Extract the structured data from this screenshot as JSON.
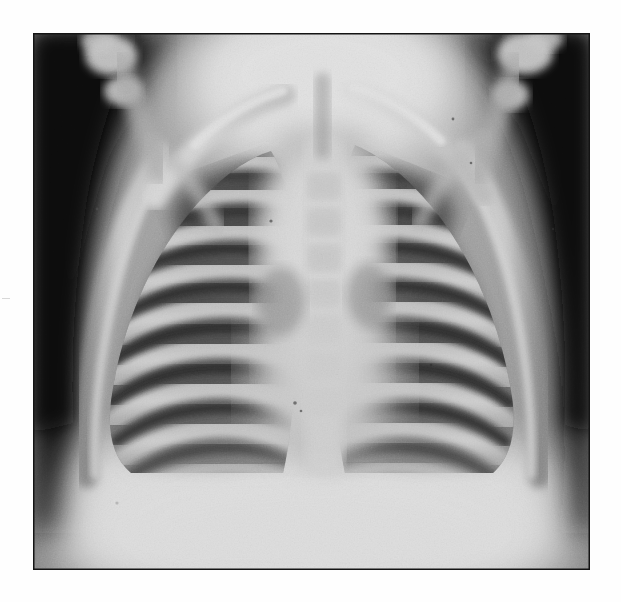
{
  "document": {
    "type": "radiograph-photograph",
    "modality_label": "chest-radiograph",
    "view_label": "anteroposterior",
    "subject_label": "pediatric-thorax",
    "page_background_color": "#fefefe",
    "caption_text": ""
  },
  "image": {
    "frame_left": 33,
    "frame_top": 33,
    "frame_width": 557,
    "frame_height": 537,
    "border_color": "#111111",
    "film_background_color": "#111111"
  },
  "tonal_palette": {
    "background_black": "#101010",
    "soft_tissue_shadow": "#3a3a3a",
    "lung_field_dark": "#4a4a4a",
    "intercostal_dark": "#3c3c3c",
    "lung_field_mid": "#7a7a7a",
    "rib_bone_bright": "#d2d2d2",
    "mediastinum_bright": "#dcdcdc",
    "clavicle_bright": "#e4e4e4",
    "diaphragm_bright": "#e6e6e6",
    "highlight_white": "#efefef"
  },
  "anatomy": {
    "regions": [
      {
        "name": "background-left",
        "label": "Dark exposure background, left of thorax"
      },
      {
        "name": "background-right",
        "label": "Dark exposure background, right of thorax"
      },
      {
        "name": "neck-soft-tissue",
        "label": "Bright neck and upper mediastinal soft tissue"
      },
      {
        "name": "clavicle-left",
        "label": "Left clavicle, bright oblique band"
      },
      {
        "name": "clavicle-right",
        "label": "Right clavicle, bright oblique band"
      },
      {
        "name": "humeral-head-left",
        "label": "Left proximal humerus / shoulder ossification"
      },
      {
        "name": "humeral-head-right",
        "label": "Right proximal humerus / shoulder ossification"
      },
      {
        "name": "mediastinum",
        "label": "Central bright mediastinum and thymus"
      },
      {
        "name": "spine",
        "label": "Vertebral column, bright midline"
      },
      {
        "name": "lung-field-left",
        "label": "Left lung field, dark aerated lung"
      },
      {
        "name": "lung-field-right",
        "label": "Right lung field, dark aerated lung"
      },
      {
        "name": "rib-cage-left",
        "label": "Left posterior ribs, bright arcs"
      },
      {
        "name": "rib-cage-right",
        "label": "Right posterior ribs, bright arcs"
      },
      {
        "name": "lateral-chest-wall-left",
        "label": "Left lateral chest wall margin"
      },
      {
        "name": "lateral-chest-wall-right",
        "label": "Right lateral chest wall margin"
      },
      {
        "name": "diaphragm",
        "label": "Diaphragm and upper abdomen, bright"
      },
      {
        "name": "film-grain",
        "label": "Halftone film grain texture overlay"
      }
    ],
    "rib_counts": {
      "left": 9,
      "right": 9
    },
    "lung_left_center": {
      "x": 180,
      "y": 300
    },
    "lung_right_center": {
      "x": 430,
      "y": 290
    },
    "mediastinum_center": {
      "x": 305,
      "y": 260
    },
    "diaphragm_top_y": 430
  }
}
